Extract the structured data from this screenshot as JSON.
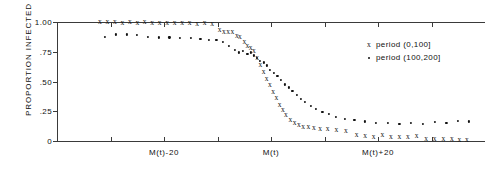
{
  "chart_data": {
    "type": "scatter",
    "title": "",
    "xlabel": "",
    "ylabel": "PROPORTION  INFECTED",
    "ylim": [
      0,
      1.0
    ],
    "yticks": [
      1.0,
      0.75,
      0.5,
      0.25,
      0
    ],
    "ytick_labels": [
      "1.00",
      ".75",
      ".50",
      ".25",
      "0"
    ],
    "xlim": [
      -40,
      40
    ],
    "xtick_positions": [
      -30,
      -20,
      -10,
      0,
      10,
      20,
      30
    ],
    "xtick_labels": [
      "",
      "M(t)-20",
      "",
      "M(t)",
      "",
      "M(t)+20",
      ""
    ],
    "grid": false,
    "legend_position": "upper-right",
    "series": [
      {
        "name": "period (0,100]",
        "marker": "x",
        "points": [
          [
            -32.0,
            1.0
          ],
          [
            -30.6,
            1.0
          ],
          [
            -29.2,
            1.0
          ],
          [
            -27.8,
            0.995
          ],
          [
            -26.4,
            1.0
          ],
          [
            -25.0,
            0.995
          ],
          [
            -23.6,
            1.0
          ],
          [
            -22.2,
            0.99
          ],
          [
            -20.8,
            0.995
          ],
          [
            -19.4,
            0.99
          ],
          [
            -18.0,
            0.995
          ],
          [
            -16.6,
            0.99
          ],
          [
            -15.2,
            0.99
          ],
          [
            -13.8,
            0.985
          ],
          [
            -12.4,
            0.99
          ],
          [
            -11.0,
            0.985
          ],
          [
            -9.6,
            0.93
          ],
          [
            -8.8,
            0.92
          ],
          [
            -8.0,
            0.92
          ],
          [
            -7.2,
            0.915
          ],
          [
            -6.4,
            0.88
          ],
          [
            -5.8,
            0.87
          ],
          [
            -5.0,
            0.83
          ],
          [
            -4.4,
            0.8
          ],
          [
            -3.8,
            0.78
          ],
          [
            -3.2,
            0.76
          ],
          [
            -2.6,
            0.7
          ],
          [
            -2.0,
            0.64
          ],
          [
            -1.4,
            0.58
          ],
          [
            -0.8,
            0.52
          ],
          [
            -0.2,
            0.47
          ],
          [
            0.4,
            0.41
          ],
          [
            1.0,
            0.36
          ],
          [
            1.6,
            0.3
          ],
          [
            2.2,
            0.26
          ],
          [
            2.8,
            0.22
          ],
          [
            3.6,
            0.18
          ],
          [
            4.4,
            0.155
          ],
          [
            5.2,
            0.135
          ],
          [
            6.0,
            0.12
          ],
          [
            7.0,
            0.115
          ],
          [
            8.0,
            0.11
          ],
          [
            9.2,
            0.105
          ],
          [
            10.6,
            0.1
          ],
          [
            12.2,
            0.095
          ],
          [
            14.0,
            0.085
          ],
          [
            16.0,
            0.05
          ],
          [
            17.6,
            0.04
          ],
          [
            19.2,
            0.035
          ],
          [
            20.8,
            0.05
          ],
          [
            22.4,
            0.035
          ],
          [
            24.0,
            0.03
          ],
          [
            25.6,
            0.03
          ],
          [
            27.2,
            0.045
          ],
          [
            29.0,
            0.02
          ],
          [
            30.6,
            0.02
          ],
          [
            32.2,
            0.015
          ],
          [
            33.8,
            0.015
          ],
          [
            35.2,
            0.01
          ],
          [
            36.6,
            0.01
          ]
        ]
      },
      {
        "name": "period (100,200]",
        "marker": "dot",
        "points": [
          [
            -31.0,
            0.875
          ],
          [
            -29.0,
            0.895
          ],
          [
            -27.0,
            0.895
          ],
          [
            -25.0,
            0.89
          ],
          [
            -23.0,
            0.875
          ],
          [
            -21.0,
            0.87
          ],
          [
            -19.0,
            0.87
          ],
          [
            -17.0,
            0.865
          ],
          [
            -15.0,
            0.865
          ],
          [
            -13.2,
            0.855
          ],
          [
            -11.6,
            0.85
          ],
          [
            -10.2,
            0.85
          ],
          [
            -9.0,
            0.83
          ],
          [
            -7.8,
            0.8
          ],
          [
            -6.8,
            0.765
          ],
          [
            -6.0,
            0.745
          ],
          [
            -5.2,
            0.755
          ],
          [
            -4.4,
            0.735
          ],
          [
            -3.8,
            0.745
          ],
          [
            -3.2,
            0.72
          ],
          [
            -2.6,
            0.7
          ],
          [
            -2.0,
            0.675
          ],
          [
            -1.4,
            0.66
          ],
          [
            -0.8,
            0.635
          ],
          [
            -0.2,
            0.6
          ],
          [
            0.5,
            0.575
          ],
          [
            1.2,
            0.545
          ],
          [
            1.9,
            0.51
          ],
          [
            2.6,
            0.475
          ],
          [
            3.3,
            0.45
          ],
          [
            4.0,
            0.42
          ],
          [
            4.8,
            0.385
          ],
          [
            5.6,
            0.355
          ],
          [
            6.4,
            0.33
          ],
          [
            7.4,
            0.295
          ],
          [
            8.4,
            0.27
          ],
          [
            9.6,
            0.245
          ],
          [
            10.8,
            0.225
          ],
          [
            12.2,
            0.2
          ],
          [
            13.8,
            0.185
          ],
          [
            15.6,
            0.175
          ],
          [
            17.6,
            0.165
          ],
          [
            19.6,
            0.155
          ],
          [
            21.8,
            0.15
          ],
          [
            24.0,
            0.145
          ],
          [
            26.2,
            0.15
          ],
          [
            28.4,
            0.145
          ],
          [
            30.6,
            0.16
          ],
          [
            32.8,
            0.155
          ],
          [
            35.0,
            0.17
          ],
          [
            37.0,
            0.165
          ]
        ]
      }
    ]
  },
  "legend": {
    "entries": [
      {
        "marker": "x",
        "label": "period (0,100]"
      },
      {
        "marker": "dot",
        "label": "period (100,200]"
      }
    ]
  }
}
